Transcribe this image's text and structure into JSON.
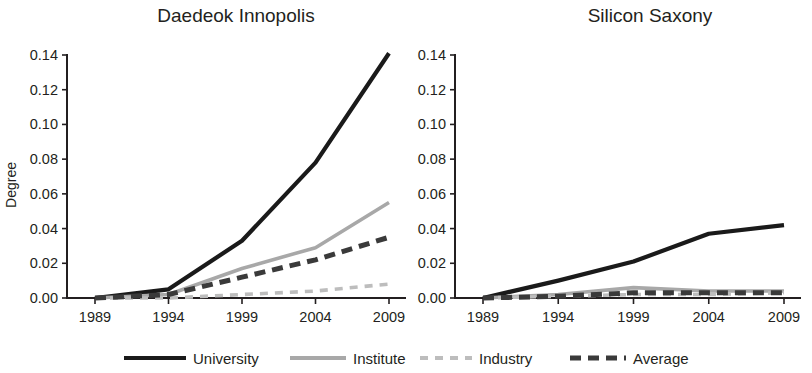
{
  "figure": {
    "y_axis_label": "Degree",
    "y_ticks": [
      "0.00",
      "0.02",
      "0.04",
      "0.06",
      "0.08",
      "0.10",
      "0.12",
      "0.14"
    ],
    "y_tick_values": [
      0.0,
      0.02,
      0.04,
      0.06,
      0.08,
      0.1,
      0.12,
      0.14
    ],
    "x_ticks": [
      "1989",
      "1994",
      "1999",
      "2004",
      "2009"
    ]
  },
  "legend": {
    "position": "bottom-center",
    "items": [
      {
        "label": "University",
        "color": "#1a1a1a",
        "style": "solid",
        "width": 4
      },
      {
        "label": "Institute",
        "color": "#a8a8a8",
        "style": "solid",
        "width": 4
      },
      {
        "label": "Industry",
        "color": "#bdbdbd",
        "style": "dashed",
        "width": 4
      },
      {
        "label": "Average",
        "color": "#3a3a3a",
        "style": "dashed",
        "width": 5
      }
    ]
  },
  "chart_data": [
    {
      "type": "line",
      "title": "Daedeok Innopolis",
      "xlabel": "",
      "ylabel": "Degree",
      "x": [
        1989,
        1994,
        1999,
        2004,
        2009
      ],
      "categories": [
        "1989",
        "1994",
        "1999",
        "2004",
        "2009"
      ],
      "xlim": [
        1987,
        2011
      ],
      "ylim": [
        0.0,
        0.14
      ],
      "grid": false,
      "series": [
        {
          "name": "University",
          "color": "#1a1a1a",
          "style": "solid",
          "values": [
            0.0,
            0.005,
            0.033,
            0.078,
            0.141
          ]
        },
        {
          "name": "Institute",
          "color": "#a8a8a8",
          "style": "solid",
          "values": [
            0.0,
            0.002,
            0.017,
            0.029,
            0.055
          ]
        },
        {
          "name": "Industry",
          "color": "#bdbdbd",
          "style": "dashed",
          "values": [
            0.0,
            0.0,
            0.002,
            0.004,
            0.008
          ]
        },
        {
          "name": "Average",
          "color": "#3a3a3a",
          "style": "dashed",
          "values": [
            0.0,
            0.002,
            0.012,
            0.022,
            0.035
          ]
        }
      ]
    },
    {
      "type": "line",
      "title": "Silicon Saxony",
      "xlabel": "",
      "ylabel": "",
      "x": [
        1989,
        1994,
        1999,
        2004,
        2009
      ],
      "categories": [
        "1989",
        "1994",
        "1999",
        "2004",
        "2009"
      ],
      "xlim": [
        1987,
        2011
      ],
      "ylim": [
        0.0,
        0.14
      ],
      "grid": false,
      "series": [
        {
          "name": "University",
          "color": "#1a1a1a",
          "style": "solid",
          "values": [
            0.0,
            0.01,
            0.021,
            0.037,
            0.042
          ]
        },
        {
          "name": "Institute",
          "color": "#a8a8a8",
          "style": "solid",
          "values": [
            0.0,
            0.002,
            0.006,
            0.004,
            0.004
          ]
        },
        {
          "name": "Industry",
          "color": "#bdbdbd",
          "style": "dashed",
          "values": [
            0.0,
            0.001,
            0.002,
            0.002,
            0.003
          ]
        },
        {
          "name": "Average",
          "color": "#3a3a3a",
          "style": "dashed",
          "values": [
            0.0,
            0.001,
            0.003,
            0.003,
            0.003
          ]
        }
      ]
    }
  ]
}
